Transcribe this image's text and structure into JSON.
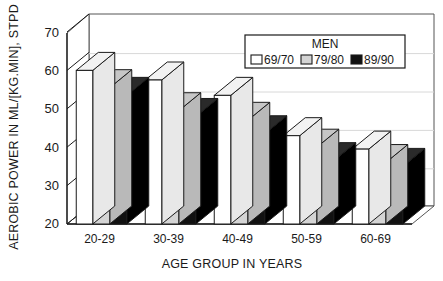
{
  "chart_data": {
    "type": "bar",
    "title": "",
    "subtitle": "",
    "xlabel": "AGE GROUP IN YEARS",
    "ylabel": "AEROBIC POWER IN ML/[KG.MIN], STPD",
    "categories": [
      "20-29",
      "30-39",
      "40-49",
      "50-59",
      "60-69"
    ],
    "series": [
      {
        "name": "69/70",
        "color": "#ffffff",
        "values": [
          60.0,
          57.5,
          53.5,
          43.0,
          39.5
        ]
      },
      {
        "name": "79/80",
        "color": "#d4d4d4",
        "values": [
          55.5,
          49.5,
          47.0,
          40.0,
          36.0
        ]
      },
      {
        "name": "89/90",
        "color": "#111111",
        "values": [
          53.5,
          48.0,
          43.5,
          36.5,
          35.0
        ]
      }
    ],
    "ylim": [
      20,
      70
    ],
    "yticks": [
      20,
      30,
      40,
      50,
      60,
      70
    ],
    "ytick_labels": [
      "20",
      "30",
      "40",
      "50",
      "60",
      "70"
    ],
    "grid": true,
    "legend_position": "top-right",
    "legend_title": "MEN",
    "style": "3d-bar"
  },
  "legend": {
    "title": "MEN",
    "entries": [
      {
        "label": "69/70",
        "swatch": "white"
      },
      {
        "label": "79/80",
        "swatch": "light-gray"
      },
      {
        "label": "89/90",
        "swatch": "black"
      }
    ]
  },
  "colors": {
    "series_1": "#ffffff",
    "series_2": "#d4d4d4",
    "series_3": "#111111",
    "outline": "#1a1a1a",
    "grid": "#cfcfcf",
    "background": "#ffffff"
  }
}
